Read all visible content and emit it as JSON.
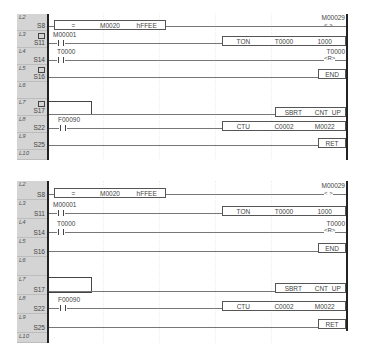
{
  "panels": [
    {
      "id": "top",
      "rows": [
        {
          "line": "L2",
          "step": "S8",
          "has_marker": false
        },
        {
          "line": "L3",
          "step": "S11",
          "has_marker": true
        },
        {
          "line": "L4",
          "step": "S14",
          "has_marker": false
        },
        {
          "line": "L5",
          "step": "S16",
          "has_marker": true
        },
        {
          "line": "L6",
          "step": "",
          "has_marker": false
        },
        {
          "line": "L7",
          "step": "S17",
          "has_marker": true
        },
        {
          "line": "L8",
          "step": "S22",
          "has_marker": false
        },
        {
          "line": "L9",
          "step": "S25",
          "has_marker": false
        },
        {
          "line": "L10",
          "step": "",
          "has_marker": false
        }
      ],
      "compare_block": {
        "op": "=",
        "operand1": "M0020",
        "operand2": "hFFEE"
      },
      "coil_output": {
        "address": "M00029",
        "symbol": "< >"
      },
      "contact_1": "M00001",
      "timer_block": {
        "instr": "TON",
        "timer": "T0000",
        "preset": "1000"
      },
      "contact_2": "T0000",
      "reset_coil": {
        "address": "T0000",
        "symbol": "<R>"
      },
      "end_label": "END",
      "sbrt_block": {
        "instr": "SBRT",
        "name": "CNT_UP"
      },
      "contact_3": "F00090",
      "ctu_block": {
        "instr": "CTU",
        "counter": "C0002",
        "preset": "M0022"
      },
      "ret_label": "RET"
    },
    {
      "id": "bottom",
      "rows": [
        {
          "line": "L2",
          "step": "S8",
          "has_marker": false
        },
        {
          "line": "L3",
          "step": "S11",
          "has_marker": false
        },
        {
          "line": "L4",
          "step": "S14",
          "has_marker": false
        },
        {
          "line": "L5",
          "step": "S16",
          "has_marker": false
        },
        {
          "line": "L6",
          "step": "",
          "has_marker": false
        },
        {
          "line": "L7",
          "step": "S17",
          "has_marker": false
        },
        {
          "line": "L8",
          "step": "S22",
          "has_marker": false
        },
        {
          "line": "L9",
          "step": "S25",
          "has_marker": false
        },
        {
          "line": "L10",
          "step": "",
          "has_marker": false
        }
      ],
      "compare_block": {
        "op": "=",
        "operand1": "M0020",
        "operand2": "hFFEE"
      },
      "coil_output": {
        "address": "M00029",
        "symbol": "< >"
      },
      "contact_1": "M00001",
      "timer_block": {
        "instr": "TON",
        "timer": "T0000",
        "preset": "1000"
      },
      "contact_2": "T0000",
      "reset_coil": {
        "address": "T0000",
        "symbol": "<R>"
      },
      "end_label": "END",
      "sbrt_block": {
        "instr": "SBRT",
        "name": "CNT_UP"
      },
      "contact_3": "F00090",
      "ctu_block": {
        "instr": "CTU",
        "counter": "C0002",
        "preset": "M0022"
      },
      "ret_label": "RET"
    }
  ]
}
